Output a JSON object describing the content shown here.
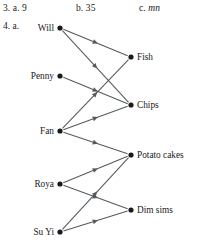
{
  "answers": {
    "prefix": "3.",
    "items": [
      {
        "id": "a",
        "label": "a.",
        "value": "9",
        "italic": false
      },
      {
        "id": "b",
        "label": "b.",
        "value": "35",
        "italic": false
      },
      {
        "id": "c",
        "label": "c.",
        "value": "mn",
        "italic": true
      }
    ]
  },
  "question4": {
    "label": "4. a."
  },
  "chart_data": {
    "type": "diagram",
    "subtype": "bipartite-directed-graph",
    "title": "",
    "left_nodes": [
      {
        "id": "will",
        "label": "Will",
        "x": 60,
        "y": 28
      },
      {
        "id": "penny",
        "label": "Penny",
        "x": 60,
        "y": 76
      },
      {
        "id": "fan",
        "label": "Fan",
        "x": 60,
        "y": 131
      },
      {
        "id": "roya",
        "label": "Roya",
        "x": 60,
        "y": 184
      },
      {
        "id": "suyi",
        "label": "Su Yi",
        "x": 60,
        "y": 232
      }
    ],
    "right_nodes": [
      {
        "id": "fish",
        "label": "Fish",
        "x": 131,
        "y": 57
      },
      {
        "id": "chips",
        "label": "Chips",
        "x": 131,
        "y": 105
      },
      {
        "id": "potato_cakes",
        "label": "Potato cakes",
        "x": 131,
        "y": 155
      },
      {
        "id": "dim_sims",
        "label": "Dim sims",
        "x": 131,
        "y": 210
      }
    ],
    "edges": [
      {
        "from": "will",
        "to": "fish"
      },
      {
        "from": "will",
        "to": "chips"
      },
      {
        "from": "penny",
        "to": "chips"
      },
      {
        "from": "fan",
        "to": "fish"
      },
      {
        "from": "fan",
        "to": "chips"
      },
      {
        "from": "fan",
        "to": "potato_cakes"
      },
      {
        "from": "roya",
        "to": "potato_cakes"
      },
      {
        "from": "roya",
        "to": "dim_sims"
      },
      {
        "from": "suyi",
        "to": "potato_cakes"
      },
      {
        "from": "suyi",
        "to": "dim_sims"
      }
    ],
    "colors": {
      "edge": "#555a5e",
      "node": "#1a1a1a",
      "text": "#1a1a1a",
      "background": "#ffffff"
    }
  }
}
